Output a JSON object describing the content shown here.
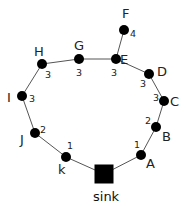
{
  "diagram": {
    "type": "tree",
    "colors": {
      "node": "#000000",
      "edge": "#555555",
      "text": "#222222"
    },
    "sink": {
      "id": "sink",
      "label": "sink",
      "shape": "square"
    },
    "nodes": [
      {
        "id": "A",
        "label": "A",
        "weight": "1"
      },
      {
        "id": "B",
        "label": "B",
        "weight": "2"
      },
      {
        "id": "C",
        "label": "C",
        "weight": "3"
      },
      {
        "id": "D",
        "label": "D",
        "weight": "3"
      },
      {
        "id": "E",
        "label": "E",
        "weight": "3"
      },
      {
        "id": "F",
        "label": "F",
        "weight": "4"
      },
      {
        "id": "G",
        "label": "G",
        "weight": "3"
      },
      {
        "id": "H",
        "label": "H",
        "weight": "3"
      },
      {
        "id": "I",
        "label": "I",
        "weight": "3"
      },
      {
        "id": "J",
        "label": "J",
        "weight": "2"
      },
      {
        "id": "k",
        "label": "k",
        "weight": "1"
      }
    ],
    "edges": [
      [
        "sink",
        "A"
      ],
      [
        "A",
        "B"
      ],
      [
        "B",
        "C"
      ],
      [
        "C",
        "D"
      ],
      [
        "D",
        "E"
      ],
      [
        "E",
        "F"
      ],
      [
        "E",
        "G"
      ],
      [
        "G",
        "H"
      ],
      [
        "H",
        "I"
      ],
      [
        "I",
        "J"
      ],
      [
        "J",
        "k"
      ],
      [
        "k",
        "sink"
      ]
    ]
  }
}
